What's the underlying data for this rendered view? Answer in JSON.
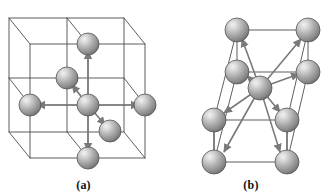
{
  "figure": {
    "background_color": "#ffffff",
    "panels": [
      {
        "id": "a",
        "label": "(a)",
        "structure": "simple-cubic",
        "coordination_number": 6,
        "description": "Simple cubic lattice showing a central atom with six nearest neighbours along the +x, -x, +y, -y, +z and -z directions",
        "lattice_line_color": "#4d4d4d",
        "arrow_color": "#7a7a7a",
        "sphere_fill_light": "#e2e2e2",
        "sphere_fill_mid": "#a8a8a8",
        "sphere_fill_dark": "#6e6e6e",
        "sphere_outline": "#555555",
        "sphere_radius": 11,
        "atoms": [
          {
            "name": "center-atom",
            "cx": 88,
            "cy": 105
          },
          {
            "name": "neighbor-right",
            "cx": 145,
            "cy": 105
          },
          {
            "name": "neighbor-left",
            "cx": 30,
            "cy": 105
          },
          {
            "name": "neighbor-top",
            "cx": 88,
            "cy": 44
          },
          {
            "name": "neighbor-bottom",
            "cx": 88,
            "cy": 158
          },
          {
            "name": "neighbor-back-left",
            "cx": 67,
            "cy": 78
          },
          {
            "name": "neighbor-front-right",
            "cx": 110,
            "cy": 131
          }
        ],
        "arrows": [
          {
            "name": "arrow-right",
            "x1": 88,
            "y1": 105,
            "x2": 145,
            "y2": 105
          },
          {
            "name": "arrow-left",
            "x1": 88,
            "y1": 105,
            "x2": 30,
            "y2": 105
          },
          {
            "name": "arrow-up",
            "x1": 88,
            "y1": 105,
            "x2": 88,
            "y2": 44
          },
          {
            "name": "arrow-down",
            "x1": 88,
            "y1": 105,
            "x2": 88,
            "y2": 158
          },
          {
            "name": "arrow-back-left",
            "x1": 88,
            "y1": 105,
            "x2": 67,
            "y2": 78
          },
          {
            "name": "arrow-front-right",
            "x1": 88,
            "y1": 105,
            "x2": 110,
            "y2": 131
          }
        ]
      },
      {
        "id": "b",
        "label": "(b)",
        "structure": "body-centered-cubic",
        "coordination_number": 8,
        "description": "Body centred cubic unit cell showing the body centre atom with eight nearest neighbours at the cube corners",
        "lattice_line_color": "#4d4d4d",
        "arrow_color": "#7a7a7a",
        "sphere_fill_light": "#e2e2e2",
        "sphere_fill_mid": "#a8a8a8",
        "sphere_fill_dark": "#6e6e6e",
        "sphere_outline": "#555555",
        "sphere_radius": 12,
        "atoms": [
          {
            "name": "body-center-atom",
            "cx": 93,
            "cy": 88
          },
          {
            "name": "corner-front-top-left",
            "cx": 47,
            "cy": 120
          },
          {
            "name": "corner-front-top-right",
            "cx": 120,
            "cy": 120
          },
          {
            "name": "corner-front-bottom-left",
            "cx": 47,
            "cy": 162
          },
          {
            "name": "corner-front-bottom-right",
            "cx": 120,
            "cy": 162
          },
          {
            "name": "corner-back-top-left",
            "cx": 70,
            "cy": 30
          },
          {
            "name": "corner-back-top-right",
            "cx": 141,
            "cy": 30
          },
          {
            "name": "corner-back-bottom-left",
            "cx": 70,
            "cy": 72
          },
          {
            "name": "corner-back-bottom-right",
            "cx": 141,
            "cy": 72
          }
        ],
        "arrows": [
          {
            "name": "arrow-to-front-top-left",
            "x1": 93,
            "y1": 88,
            "x2": 47,
            "y2": 120
          },
          {
            "name": "arrow-to-front-top-right",
            "x1": 93,
            "y1": 88,
            "x2": 120,
            "y2": 120
          },
          {
            "name": "arrow-to-front-bottom-left",
            "x1": 93,
            "y1": 88,
            "x2": 47,
            "y2": 162
          },
          {
            "name": "arrow-to-front-bottom-right",
            "x1": 93,
            "y1": 88,
            "x2": 120,
            "y2": 162
          },
          {
            "name": "arrow-to-back-top-left",
            "x1": 93,
            "y1": 88,
            "x2": 70,
            "y2": 30
          },
          {
            "name": "arrow-to-back-top-right",
            "x1": 93,
            "y1": 88,
            "x2": 141,
            "y2": 30
          },
          {
            "name": "arrow-to-back-bottom-left",
            "x1": 93,
            "y1": 88,
            "x2": 70,
            "y2": 72
          },
          {
            "name": "arrow-to-back-bottom-right",
            "x1": 93,
            "y1": 88,
            "x2": 141,
            "y2": 72
          }
        ]
      }
    ]
  }
}
